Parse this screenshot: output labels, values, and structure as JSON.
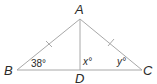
{
  "figure": {
    "type": "triangle-diagram",
    "vertices": {
      "A": {
        "label": "A",
        "x": 80,
        "y": 19
      },
      "B": {
        "label": "B",
        "x": 17,
        "y": 70
      },
      "C": {
        "label": "C",
        "x": 142,
        "y": 70
      },
      "D": {
        "label": "D",
        "x": 80,
        "y": 70
      }
    },
    "segments": [
      "AB",
      "AC",
      "BC",
      "AD"
    ],
    "congruent_marks": [
      "AB",
      "AC"
    ],
    "angles": {
      "B": {
        "label": "38°",
        "value": 38
      },
      "ADC": {
        "label": "x°",
        "variable": "x"
      },
      "C": {
        "label": "y°",
        "variable": "y"
      }
    },
    "colors": {
      "line": "#a8a8a8",
      "text": "#2a2a2a",
      "background": "#ffffff"
    }
  }
}
